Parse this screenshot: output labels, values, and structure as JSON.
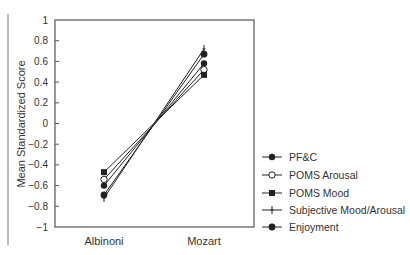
{
  "chart_data": {
    "type": "line",
    "title": "",
    "xlabel": "",
    "ylabel": "Mean Standardized Score",
    "categories": [
      "Albinoni",
      "Mozart"
    ],
    "ylim": [
      -1,
      1
    ],
    "yticks": [
      1,
      0.8,
      0.6,
      0.4,
      0.2,
      0,
      -0.2,
      -0.4,
      -0.6,
      -0.8,
      -1
    ],
    "ytick_labels": [
      "1",
      "0.8",
      "0.6",
      "0.4",
      "0.2",
      "0",
      "−0.2",
      "−0.4",
      "−0.6",
      "−0.8",
      "−1"
    ],
    "grid": false,
    "legend_position": "right-bottom",
    "series": [
      {
        "name": "PF&C",
        "marker": "filled-circle",
        "values": [
          -0.6,
          0.58
        ]
      },
      {
        "name": "POMS Arousal",
        "marker": "open-circle",
        "values": [
          -0.54,
          0.52
        ]
      },
      {
        "name": "POMS Mood",
        "marker": "filled-square",
        "values": [
          -0.47,
          0.47
        ]
      },
      {
        "name": "Subjective Mood/Arousal",
        "marker": "cross",
        "values": [
          -0.72,
          0.72
        ]
      },
      {
        "name": "Enjoyment",
        "marker": "filled-diamond",
        "values": [
          -0.69,
          0.67
        ]
      }
    ]
  },
  "colors": {
    "line": "#222222",
    "axis": "#555555",
    "text": "#333333"
  }
}
